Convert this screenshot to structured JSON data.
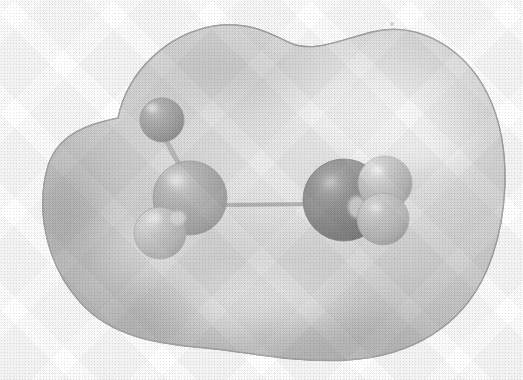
{
  "figure": {
    "kind": "molecular-model",
    "caption": "",
    "background_color": "#ffffff",
    "canvas": {
      "width": 523,
      "height": 380
    }
  },
  "surface": {
    "name": "electron-density-isosurface",
    "style": "semi-transparent solid grayscale",
    "base_color": "#c4c4c4",
    "highlight_color": "#f2f2f2",
    "shadow_color": "#9d9d9d",
    "edge_color": "#a8a8a8",
    "outline_path": "M 118 118 C 128 70, 168 34, 214 26 C 246 21, 268 32, 288 42 C 312 54, 340 40, 372 32 C 420 20, 470 50, 492 104 C 512 154, 508 222, 486 272 C 462 326, 412 356, 348 360 C 292 363, 248 352, 206 348 C 160 344, 112 338, 80 302 C 44 262, 36 206, 48 166 C 58 134, 88 124, 118 118 Z",
    "highlight_spots": [
      {
        "cx": 380,
        "cy": 112,
        "rx": 110,
        "ry": 58,
        "intensity": 0.85
      },
      {
        "cx": 262,
        "cy": 300,
        "rx": 120,
        "ry": 46,
        "intensity": 0.45
      },
      {
        "cx": 150,
        "cy": 248,
        "rx": 70,
        "ry": 40,
        "intensity": 0.35
      }
    ],
    "shadow_spots": [
      {
        "cx": 66,
        "cy": 214,
        "rx": 54,
        "ry": 96,
        "intensity": 0.55
      },
      {
        "cx": 232,
        "cy": 72,
        "rx": 110,
        "ry": 44,
        "intensity": 0.4
      },
      {
        "cx": 330,
        "cy": 336,
        "rx": 140,
        "ry": 40,
        "intensity": 0.35
      }
    ]
  },
  "chart_data": {
    "type": "scatter",
    "title": "",
    "xlabel": "",
    "ylabel": "",
    "grid": false,
    "legend": "none",
    "atoms": [
      {
        "id": "atom-1",
        "label": "upper-left-terminal-atom",
        "cx": 162,
        "cy": 120,
        "r": 22,
        "fill": "#8d8d8d",
        "shade_dark": "#6f6f6f",
        "highlight": "#b6b6b6",
        "highlight_cx": 152,
        "highlight_cy": 108,
        "depth": "back"
      },
      {
        "id": "atom-2",
        "label": "central-atom",
        "cx": 190,
        "cy": 198,
        "r": 37,
        "fill": "#9a9a9a",
        "shade_dark": "#7b7b7b",
        "highlight": "#c2c2c2",
        "highlight_cx": 176,
        "highlight_cy": 180,
        "depth": "mid"
      },
      {
        "id": "atom-3",
        "label": "lower-left-terminal-atom",
        "cx": 160,
        "cy": 233,
        "r": 26,
        "fill": "#b4b4b4",
        "shade_dark": "#8e8e8e",
        "highlight": "#e2e2e2",
        "highlight_cx": 155,
        "highlight_cy": 218,
        "depth": "front"
      },
      {
        "id": "atom-4",
        "label": "right-dark-atom",
        "cx": 344,
        "cy": 200,
        "r": 41,
        "fill": "#6b6b6b",
        "shade_dark": "#4e4e4e",
        "highlight": "#9c9c9c",
        "highlight_cx": 330,
        "highlight_cy": 182,
        "depth": "mid"
      },
      {
        "id": "atom-5",
        "label": "right-upper-terminal-atom",
        "cx": 385,
        "cy": 183,
        "r": 27,
        "fill": "#b2b2b2",
        "shade_dark": "#8c8c8c",
        "highlight": "#dedede",
        "highlight_cx": 378,
        "highlight_cy": 170,
        "depth": "front"
      },
      {
        "id": "atom-6",
        "label": "right-lower-terminal-atom",
        "cx": 383,
        "cy": 219,
        "r": 26,
        "fill": "#aeaeae",
        "shade_dark": "#878787",
        "highlight": "#d8d8d8",
        "highlight_cx": 376,
        "highlight_cy": 208,
        "depth": "front"
      }
    ],
    "bonds": [
      {
        "id": "bond-1",
        "label": "bond-upperleft-to-center",
        "x1": 166,
        "y1": 140,
        "x2": 182,
        "y2": 170,
        "width": 5,
        "color": "#a6a6a6"
      },
      {
        "id": "bond-2",
        "label": "bond-center-to-right",
        "x1": 222,
        "y1": 205,
        "x2": 318,
        "y2": 204,
        "width": 4,
        "color": "#a0a0a0"
      }
    ],
    "specks": [
      {
        "cx": 392,
        "cy": 24,
        "r": 2
      }
    ]
  }
}
